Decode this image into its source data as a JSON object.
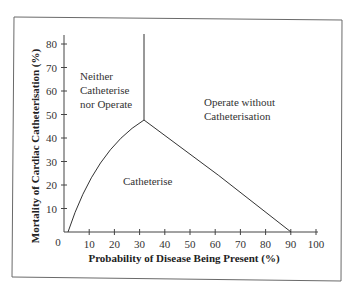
{
  "chart_data": {
    "type": "line",
    "title": "",
    "xlabel": "Probability of Disease Being Present (%)",
    "ylabel": "Mortality of Cardiac Catheterisation (%)",
    "xlim": [
      0,
      100
    ],
    "ylim": [
      0,
      85
    ],
    "x_ticks": [
      "10",
      "20",
      "30",
      "40",
      "50",
      "60",
      "70",
      "80",
      "90",
      "100"
    ],
    "y_ticks": [
      "10",
      "20",
      "30",
      "40",
      "50",
      "60",
      "70",
      "80"
    ],
    "origin_label": "0",
    "grid": false,
    "legend": null,
    "series": [
      {
        "name": "Left boundary (Neither vs Catheterise)",
        "x": [
          2,
          5,
          10,
          15,
          20,
          25,
          31
        ],
        "y": [
          0,
          10,
          21,
          30,
          37,
          42,
          47
        ]
      },
      {
        "name": "Right boundary (Catheterise vs Operate without)",
        "x": [
          31,
          40,
          50,
          60,
          70,
          80,
          90
        ],
        "y": [
          47,
          37,
          27,
          19,
          11,
          5,
          0
        ]
      },
      {
        "name": "Vertical boundary",
        "x": [
          31,
          31
        ],
        "y": [
          47,
          85
        ]
      }
    ],
    "annotations": [
      {
        "text": "Neither Catheterise nor Operate",
        "lines": [
          "Neither",
          "Catheterise",
          "nor Operate"
        ],
        "x": 5,
        "y": 63
      },
      {
        "text": "Operate without Catheterisation",
        "lines": [
          "Operate without",
          "Catheterisation"
        ],
        "x": 55,
        "y": 50
      },
      {
        "text": "Catheterise",
        "lines": [
          "Catheterise"
        ],
        "x": 45,
        "y": 17
      }
    ]
  }
}
